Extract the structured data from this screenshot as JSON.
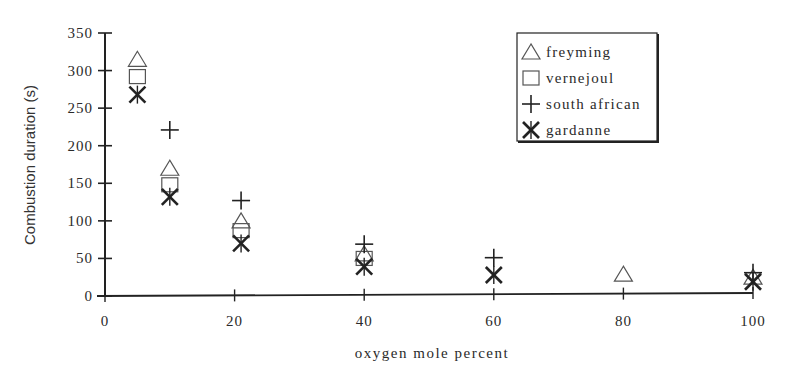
{
  "chart_data": {
    "type": "scatter",
    "title": "",
    "xlabel": "oxygen mole percent",
    "ylabel": "Combustion duration (s)",
    "xlim": [
      0,
      100
    ],
    "ylim": [
      0,
      350
    ],
    "x_ticks": [
      0,
      20,
      40,
      60,
      80,
      100
    ],
    "y_ticks": [
      0,
      50,
      100,
      150,
      200,
      250,
      300,
      350
    ],
    "grid": false,
    "legend_position": "upper right",
    "series": [
      {
        "name": "freyming",
        "marker": "triangle",
        "points": [
          [
            5,
            315
          ],
          [
            10,
            170
          ],
          [
            21,
            100
          ],
          [
            40,
            56
          ],
          [
            80,
            29
          ],
          [
            100,
            25
          ]
        ]
      },
      {
        "name": "vernejoul",
        "marker": "square",
        "points": [
          [
            5,
            292
          ],
          [
            10,
            148
          ],
          [
            21,
            87
          ],
          [
            40,
            50
          ]
        ]
      },
      {
        "name": "south african",
        "marker": "plus",
        "points": [
          [
            10,
            221
          ],
          [
            21,
            127
          ],
          [
            40,
            69
          ],
          [
            60,
            51
          ],
          [
            100,
            31
          ]
        ]
      },
      {
        "name": "gardanne",
        "marker": "asterisk",
        "points": [
          [
            5,
            268
          ],
          [
            10,
            132
          ],
          [
            21,
            70
          ],
          [
            40,
            39
          ],
          [
            60,
            28
          ],
          [
            100,
            19
          ]
        ]
      }
    ]
  },
  "colors": {
    "ink": "#222222",
    "marker_open": "#555555",
    "background": "#ffffff"
  }
}
